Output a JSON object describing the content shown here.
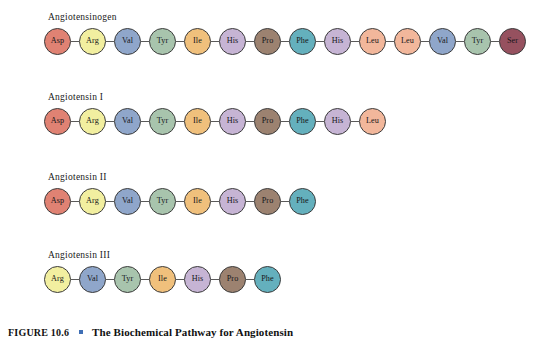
{
  "figure": {
    "number": "FIGURE 10.6",
    "bullet": "square-bullet",
    "title": "The Biochemical Pathway for Angiotensin",
    "bullet_color": "#3f6fb5",
    "background_color": "#ffffff"
  },
  "residue_colors": {
    "Asp": "#e08273",
    "Arg": "#f2efa0",
    "Val": "#8fa6ca",
    "Tyr": "#a8c4ad",
    "Ile": "#f0c07c",
    "His": "#c6b4d4",
    "Pro": "#9c8270",
    "Phe": "#64b0bd",
    "Leu": "#f2b79b",
    "Ser": "#96515f"
  },
  "rows": [
    {
      "label": "Angiotensinogen",
      "residues": [
        "Asp",
        "Arg",
        "Val",
        "Tyr",
        "Ile",
        "His",
        "Pro",
        "Phe",
        "His",
        "Leu",
        "Leu",
        "Val",
        "Tyr",
        "Ser"
      ]
    },
    {
      "label": "Angiotensin I",
      "residues": [
        "Asp",
        "Arg",
        "Val",
        "Tyr",
        "Ile",
        "His",
        "Pro",
        "Phe",
        "His",
        "Leu"
      ]
    },
    {
      "label": "Angiotensin II",
      "residues": [
        "Asp",
        "Arg",
        "Val",
        "Tyr",
        "Ile",
        "His",
        "Pro",
        "Phe"
      ]
    },
    {
      "label": "Angiotensin III",
      "residues": [
        "Arg",
        "Val",
        "Tyr",
        "Ile",
        "His",
        "Pro",
        "Phe"
      ]
    }
  ]
}
